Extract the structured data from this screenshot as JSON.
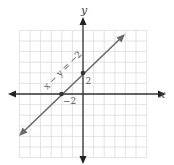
{
  "chart_data": {
    "type": "line",
    "title": "",
    "xlabel": "x",
    "ylabel": "y",
    "xlim": [
      -6,
      6
    ],
    "ylim": [
      -6,
      6
    ],
    "grid": true,
    "series": [
      {
        "name": "x − y = −2",
        "equation": "x - y = -2",
        "x": [
          -6,
          -2,
          0,
          4
        ],
        "y": [
          -4,
          0,
          2,
          6
        ],
        "points_marked": [
          {
            "x": -2,
            "y": 0,
            "label": "−2"
          },
          {
            "x": 0,
            "y": 2,
            "label": "2"
          }
        ]
      }
    ],
    "annotations": [
      "x − y = −2",
      "2",
      "−2"
    ]
  },
  "labels": {
    "x_axis": "x",
    "y_axis": "y",
    "equation": "x − y = −2",
    "y_intercept": "2",
    "x_intercept": "−2"
  },
  "colors": {
    "axis": "#333333",
    "grid": "#dcdcdc",
    "line": "#6a6a6a",
    "point": "#333333"
  }
}
